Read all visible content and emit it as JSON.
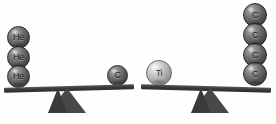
{
  "figure": {
    "type": "balance-scale-comparison",
    "background_color": "#fefefe",
    "beam_color": "#3b3b3b",
    "fulcrum_color": "#484848"
  },
  "balances": [
    {
      "id": "left",
      "tilt_degrees": -1.6,
      "left_pan": {
        "stack_label": "He",
        "count": 3,
        "spheres": [
          {
            "label": "He",
            "tone": "dark",
            "diameter": 23,
            "x": 7,
            "y": 26
          },
          {
            "label": "He",
            "tone": "dark",
            "diameter": 23,
            "x": 7,
            "y": 46
          },
          {
            "label": "He",
            "tone": "dark",
            "diameter": 23,
            "x": 7,
            "y": 65
          }
        ]
      },
      "right_pan": {
        "stack_label": "C",
        "count": 1,
        "spheres": [
          {
            "label": "C",
            "tone": "dark",
            "diameter": 21,
            "x": 107,
            "y": 65
          }
        ]
      },
      "beam": {
        "x": 4,
        "y": 86,
        "width": 130,
        "height": 5
      },
      "fulcrum": {
        "x": 48,
        "y": 88
      }
    },
    {
      "id": "right",
      "tilt_degrees": 1.6,
      "left_pan": {
        "stack_label": "Ti",
        "count": 1,
        "spheres": [
          {
            "label": "Ti",
            "tone": "light",
            "diameter": 26,
            "x": 146,
            "y": 60
          }
        ]
      },
      "right_pan": {
        "stack_label": "C",
        "count": 4,
        "spheres": [
          {
            "label": "C",
            "tone": "dark",
            "diameter": 24,
            "x": 243,
            "y": 3
          },
          {
            "label": "C",
            "tone": "dark",
            "diameter": 24,
            "x": 243,
            "y": 23
          },
          {
            "label": "C",
            "tone": "dark",
            "diameter": 24,
            "x": 243,
            "y": 43
          },
          {
            "label": "C",
            "tone": "dark",
            "diameter": 24,
            "x": 243,
            "y": 63
          }
        ]
      },
      "beam": {
        "x": 141,
        "y": 86,
        "width": 130,
        "height": 5
      },
      "fulcrum": {
        "x": 191,
        "y": 88
      }
    }
  ],
  "labels": {
    "he": "He",
    "c": "C",
    "ti": "Ti"
  }
}
